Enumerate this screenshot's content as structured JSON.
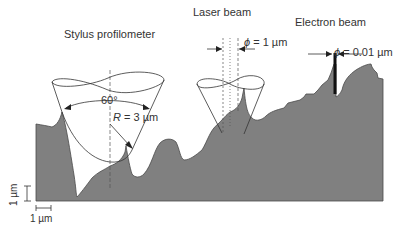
{
  "titles": {
    "stylus": "Stylus profilometer",
    "laser": "Laser beam",
    "electron": "Electron beam"
  },
  "annotations": {
    "angle": "60°",
    "radius_symbol": "R",
    "radius_value": " = 3 µm",
    "laser_phi_symbol": "ϕ",
    "laser_phi_value": " = 1 µm",
    "electron_phi_symbol": "ϕ",
    "electron_phi_value": " = 0.01 µm"
  },
  "scale_bars": {
    "vertical": "1 µm",
    "horizontal": "1 µm"
  },
  "colors": {
    "surface_fill": "#808080",
    "line": "#333333",
    "beam": "#111111"
  }
}
